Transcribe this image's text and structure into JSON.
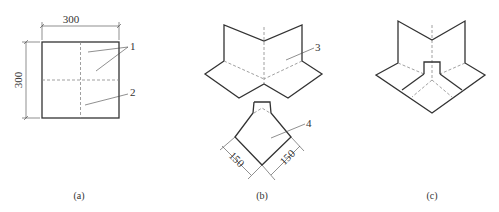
{
  "figure": {
    "panels": [
      {
        "id": "a",
        "caption": "(a)",
        "dimensions": {
          "width": "300",
          "height": "300"
        },
        "callouts": [
          "1",
          "2"
        ]
      },
      {
        "id": "b",
        "caption": "(b)",
        "dimensions": {
          "left_edge": "150",
          "right_edge": "150"
        },
        "callouts": [
          "3",
          "4"
        ]
      },
      {
        "id": "c",
        "caption": "(c)",
        "callouts": []
      }
    ]
  }
}
